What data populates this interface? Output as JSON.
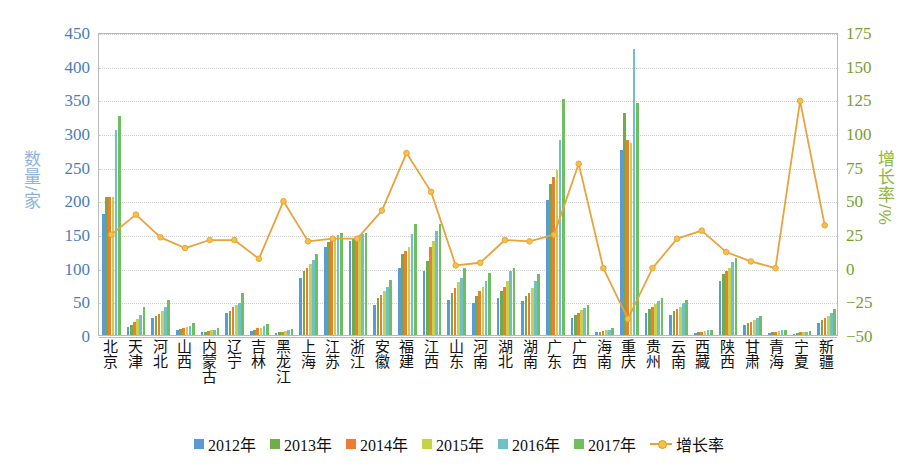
{
  "axes": {
    "y_left_title": "数量/家",
    "y_right_title": "增长率/%",
    "y_left_ticks": [
      "450",
      "400",
      "350",
      "300",
      "250",
      "200",
      "150",
      "100",
      "50",
      "0"
    ],
    "y_right_ticks": [
      "175",
      "150",
      "125",
      "100",
      "75",
      "50",
      "25",
      "0",
      "−25",
      "−50"
    ]
  },
  "legend": [
    {
      "label": "2012年",
      "color": "#5b9bd5",
      "type": "bar"
    },
    {
      "label": "2013年",
      "color": "#70ad47",
      "type": "bar"
    },
    {
      "label": "2014年",
      "color": "#ed7d31",
      "type": "bar"
    },
    {
      "label": "2015年",
      "color": "#c5d24a",
      "type": "bar"
    },
    {
      "label": "2016年",
      "color": "#6fc0c7",
      "type": "bar"
    },
    {
      "label": "2017年",
      "color": "#6fbf5f",
      "type": "bar"
    },
    {
      "label": "增长率",
      "color": "#e8a33d",
      "type": "line"
    }
  ],
  "colors": {
    "y2012": "#5b9bd5",
    "y2013": "#70ad47",
    "y2014": "#ed7d31",
    "y2015": "#c5d24a",
    "y2016": "#6fc0c7",
    "y2017": "#6fbf5f",
    "growth_line": "#e8a33d",
    "growth_marker": "#f5c242",
    "left_axis_text": "#4a7ebb",
    "right_axis_text": "#7a9e34",
    "gridline": "#cfcfcf",
    "frame": "#b9b9b9"
  },
  "chart_data": {
    "type": "bar",
    "title": "",
    "xlabel": "",
    "ylabel": "数量/家",
    "y2label": "增长率/%",
    "ylim": [
      0,
      450
    ],
    "y2lim": [
      -50,
      175
    ],
    "grid": true,
    "legend_position": "bottom",
    "categories": [
      "北京",
      "天津",
      "河北",
      "山西",
      "内蒙古",
      "辽宁",
      "吉林",
      "黑龙江",
      "上海",
      "江苏",
      "浙江",
      "安徽",
      "福建",
      "江西",
      "山东",
      "河南",
      "湖北",
      "湖南",
      "广东",
      "广西",
      "海南",
      "重庆",
      "贵州",
      "云南",
      "西藏",
      "陕西",
      "甘肃",
      "青海",
      "宁夏",
      "新疆"
    ],
    "series": [
      {
        "name": "2012年",
        "color": "#5b9bd5",
        "values": [
          180,
          12,
          25,
          7,
          4,
          33,
          6,
          3,
          85,
          130,
          140,
          45,
          100,
          95,
          52,
          48,
          55,
          50,
          200,
          25,
          4,
          275,
          32,
          30,
          3,
          80,
          15,
          3,
          2,
          18
        ]
      },
      {
        "name": "2013年",
        "color": "#70ad47",
        "values": [
          205,
          15,
          28,
          9,
          5,
          35,
          8,
          4,
          95,
          138,
          143,
          55,
          120,
          110,
          62,
          58,
          65,
          58,
          225,
          30,
          5,
          330,
          38,
          35,
          4,
          90,
          18,
          4,
          3,
          22
        ]
      },
      {
        "name": "2014年",
        "color": "#ed7d31",
        "values": [
          205,
          20,
          31,
          10,
          6,
          42,
          10,
          5,
          100,
          142,
          145,
          60,
          125,
          130,
          70,
          65,
          72,
          63,
          235,
          33,
          6,
          290,
          42,
          38,
          5,
          95,
          20,
          5,
          4,
          25
        ]
      },
      {
        "name": "2015年",
        "color": "#c5d24a",
        "values": [
          205,
          24,
          36,
          12,
          7,
          45,
          11,
          6,
          105,
          145,
          148,
          65,
          130,
          140,
          78,
          72,
          80,
          70,
          245,
          37,
          7,
          285,
          46,
          42,
          6,
          100,
          22,
          6,
          4,
          28
        ]
      },
      {
        "name": "2016年",
        "color": "#6fc0c7",
        "values": [
          305,
          30,
          42,
          14,
          8,
          48,
          13,
          7,
          112,
          148,
          150,
          72,
          150,
          155,
          85,
          80,
          95,
          80,
          290,
          40,
          8,
          425,
          50,
          48,
          7,
          108,
          25,
          7,
          5,
          32
        ]
      },
      {
        "name": "2017年",
        "color": "#6fbf5f",
        "values": [
          325,
          42,
          52,
          18,
          10,
          62,
          16,
          9,
          120,
          152,
          152,
          82,
          165,
          165,
          100,
          92,
          100,
          90,
          350,
          45,
          10,
          345,
          55,
          52,
          8,
          115,
          28,
          8,
          6,
          38
        ]
      }
    ],
    "growth_series": {
      "name": "增长率",
      "color": "#e8a33d",
      "unit": "%",
      "values": [
        25,
        40,
        23,
        15,
        21,
        21,
        7,
        50,
        20,
        22,
        22,
        43,
        86,
        57,
        2,
        4,
        21,
        20,
        25,
        78,
        0,
        -38,
        0,
        22,
        28,
        12,
        5,
        0,
        125,
        32
      ]
    }
  }
}
